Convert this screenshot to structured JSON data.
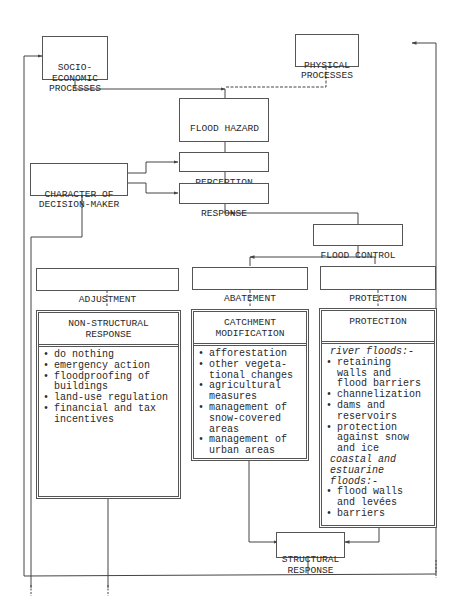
{
  "diagram": {
    "nodes": {
      "socio_economic": "SOCIO-\nECONOMIC\nPROCESSES",
      "physical": "PHYSICAL\nPROCESSES",
      "flood_hazard": {
        "title": "FLOOD HAZARD",
        "items": [
          "EXPERIENCED",
          "FORECAST"
        ]
      },
      "character": "CHARACTER OF\nDECISION-MAKER",
      "perception": "PERCEPTION",
      "response": "RESPONSE",
      "flood_control": "FLOOD CONTROL",
      "adjustment": "ADJUSTMENT",
      "abatement": "ABATEMENT",
      "protection": "PROTECTION",
      "structural_response": "STRUCTURAL\nRESPONSE"
    },
    "panels": {
      "non_structural": {
        "title": "NON-STRUCTURAL\nRESPONSE",
        "items": [
          "do nothing",
          "emergency action",
          "floodproofing of\nbuildings",
          "land-use regulation",
          "financial and tax\nincentives"
        ]
      },
      "catchment": {
        "title": "CATCHMENT\nMODIFICATION",
        "items": [
          "afforestation",
          "other vegeta-\ntional changes",
          "agricultural\nmeasures",
          "management of\nsnow-covered\nareas",
          "management of\nurban areas"
        ]
      },
      "protection": {
        "title": "PROTECTION",
        "river_heading": "river floods:-",
        "river_items": [
          "retaining\nwalls and\nflood barriers",
          "channelization",
          "dams and\nreservoirs",
          "protection\nagainst snow\nand ice"
        ],
        "coastal_heading": "coastal and\nestuarine\nfloods:-",
        "coastal_items": [
          "flood walls\nand levées",
          "barriers"
        ]
      }
    },
    "bullet": "•"
  }
}
